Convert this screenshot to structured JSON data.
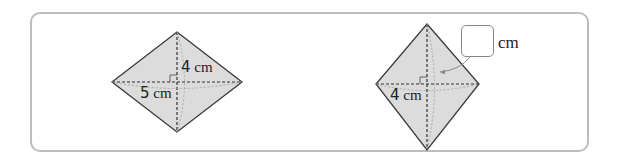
{
  "problem": {
    "figures": [
      {
        "id": "rhombus-left",
        "vertices": {
          "top": [
            177,
            32
          ],
          "left": [
            112,
            82
          ],
          "right": [
            242,
            82
          ],
          "bottom": [
            177,
            132
          ]
        },
        "labels": [
          {
            "value": "4",
            "unit": "cm",
            "refers_to": "half vertical diagonal"
          },
          {
            "value": "5",
            "unit": "cm",
            "refers_to": "half horizontal diagonal"
          }
        ]
      },
      {
        "id": "rhombus-right",
        "vertices": {
          "top": [
            427,
            24
          ],
          "left": [
            376,
            84
          ],
          "right": [
            479,
            84
          ],
          "bottom": [
            427,
            150
          ]
        },
        "labels": [
          {
            "value": "4",
            "unit": "cm",
            "refers_to": "half horizontal diagonal"
          }
        ],
        "answer_blank": {
          "value": "",
          "unit": "cm",
          "refers_to": "half vertical diagonal"
        }
      }
    ],
    "colors": {
      "fill": "#dcdcdc",
      "stroke": "#3a3a3a",
      "frame": "#bdbdbd"
    }
  }
}
